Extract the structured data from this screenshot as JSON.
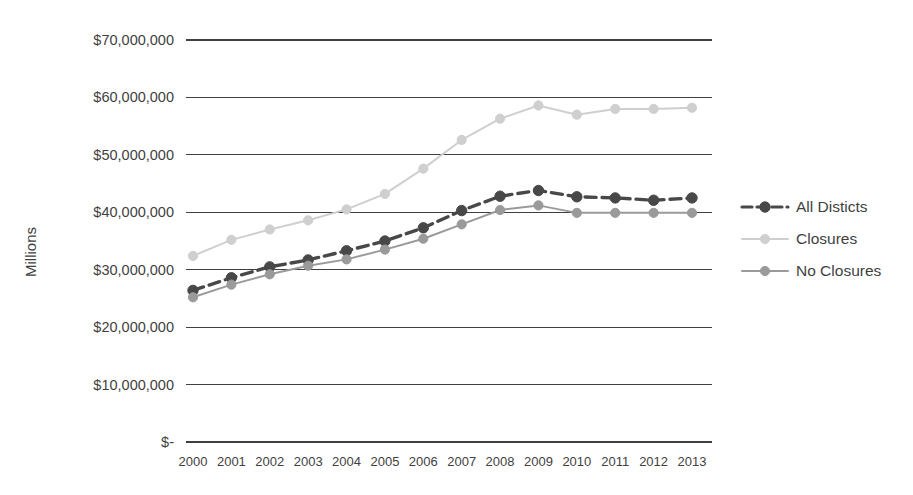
{
  "chart_data": {
    "type": "line",
    "title": "",
    "subtitle": "",
    "xlabel": "",
    "ylabel": "Millions",
    "categories": [
      "2000",
      "2001",
      "2002",
      "2003",
      "2004",
      "2005",
      "2006",
      "2007",
      "2008",
      "2009",
      "2010",
      "2011",
      "2012",
      "2013"
    ],
    "x": [
      2000,
      2001,
      2002,
      2003,
      2004,
      2005,
      2006,
      2007,
      2008,
      2009,
      2010,
      2011,
      2012,
      2013
    ],
    "ylim": [
      0,
      70000000
    ],
    "ytick_values": [
      70000000,
      60000000,
      50000000,
      40000000,
      30000000,
      20000000,
      10000000,
      0
    ],
    "ytick_labels": [
      "$70,000,000",
      "$60,000,000",
      "$50,000,000",
      "$40,000,000",
      "$30,000,000",
      "$20,000,000",
      "$10,000,000",
      "$-"
    ],
    "grid": true,
    "grid_axis": "y",
    "legend_position": "right",
    "series": [
      {
        "name": "All Disticts",
        "color": "#484848",
        "style": "dashed",
        "marker": "circle",
        "values": [
          26400000,
          28600000,
          30500000,
          31700000,
          33300000,
          35000000,
          37300000,
          40300000,
          42800000,
          43800000,
          42700000,
          42500000,
          42100000,
          42500000
        ]
      },
      {
        "name": "Closures",
        "color": "#cfcfcf",
        "style": "solid",
        "marker": "circle",
        "values": [
          32400000,
          35200000,
          37000000,
          38600000,
          40500000,
          43200000,
          47600000,
          52600000,
          56300000,
          58600000,
          57000000,
          58000000,
          58000000,
          58200000
        ]
      },
      {
        "name": "No Closures",
        "color": "#9a9a9a",
        "style": "solid",
        "marker": "circle",
        "values": [
          25200000,
          27400000,
          29200000,
          30700000,
          31800000,
          33500000,
          35400000,
          37900000,
          40400000,
          41200000,
          39900000,
          39900000,
          39900000,
          39900000
        ]
      }
    ]
  },
  "legend": {
    "items": [
      {
        "label": "All Disticts"
      },
      {
        "label": "Closures"
      },
      {
        "label": "No Closures"
      }
    ]
  },
  "axis_titles": {
    "y": "Millions"
  }
}
